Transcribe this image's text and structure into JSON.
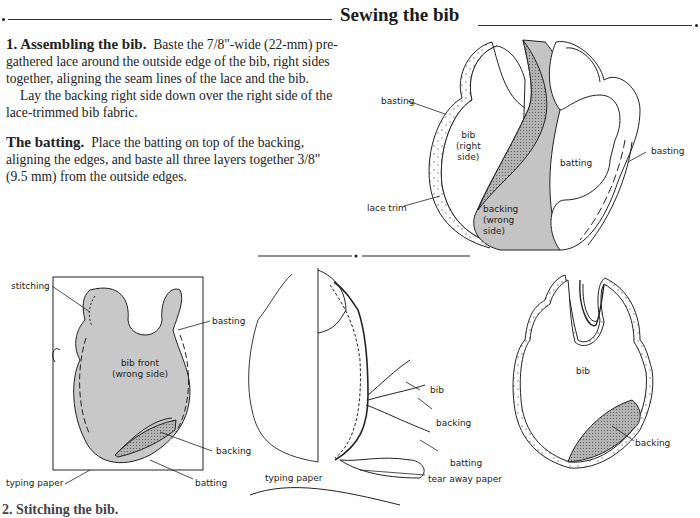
{
  "page": {
    "title": "Sewing the bib",
    "sections": [
      {
        "heading": "1. Assembling the bib.",
        "lines": [
          "Baste the 7/8\"-wide (22-mm) pre-",
          "gathered lace around the outside edge of the bib, right sides",
          "together, aligning the seam lines of the lace and the bib.",
          "Lay the backing right side down over the right side of the",
          "lace-trimmed bib fabric."
        ]
      },
      {
        "heading": "The batting.",
        "lines": [
          "Place the batting on top of the backing,",
          "aligning the edges, and baste all three layers together 3/8\"",
          "(9.5 mm) from the outside edges."
        ]
      }
    ],
    "next_heading_partial": "2. Stitching the bib."
  },
  "figures": {
    "fig1": {
      "labels": {
        "basting_left": "basting",
        "bib_right_side": [
          "bib",
          "(right",
          "side)"
        ],
        "batting": "batting",
        "basting_right": "basting",
        "lace_trim": "lace trim",
        "backing_wrong_side": [
          "backing",
          "(wrong",
          "side)"
        ]
      }
    },
    "fig2": {
      "labels": {
        "stitching": "stitching",
        "basting": "basting",
        "bib_front_wrong_side": [
          "bib front",
          "(wrong side)"
        ],
        "backing": "backing",
        "typing_paper": "typing paper",
        "batting": "batting"
      }
    },
    "fig3": {
      "labels": {
        "bib": "bib",
        "backing": "backing",
        "batting": "batting",
        "typing_paper": "typing paper",
        "tear_away_paper": "tear away paper"
      }
    },
    "fig4": {
      "labels": {
        "bib": "bib",
        "backing": "backing"
      }
    }
  },
  "colors": {
    "fabric_gray": "#c8c8c8",
    "backing_stipple": "#a8a8a8",
    "ink": "#222222"
  }
}
